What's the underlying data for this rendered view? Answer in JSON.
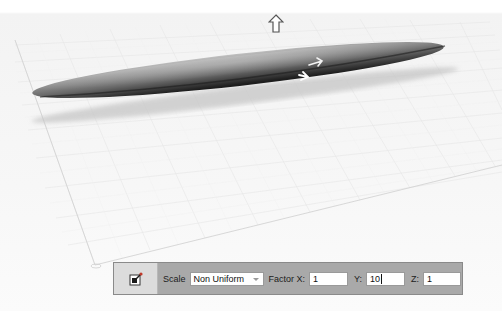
{
  "viewport": {
    "object": "elongated-ellipsoid",
    "gizmo": {
      "up_arrow": "arrow-up-icon",
      "x_arrow": "arrow-right-icon",
      "z_arrow": "arrow-diagonal-icon"
    },
    "colors": {
      "background": "#f7f7f7",
      "grid_line": "#e2e2e2",
      "axis_line": "#d0d0d0",
      "object_dark": "#2e2e2e",
      "object_light": "#b5b5b5"
    }
  },
  "toolbar": {
    "tool_icon": "scale-tool-icon",
    "scale_label": "Scale",
    "scale_mode": "Non Uniform",
    "factor_x_label": "Factor X:",
    "factor_x_value": "1",
    "y_label": "Y:",
    "y_value": "10",
    "z_label": "Z:",
    "z_value": "1",
    "colors": {
      "panel": "#a9a9a9",
      "icon_cell": "#dcdcdc"
    }
  }
}
